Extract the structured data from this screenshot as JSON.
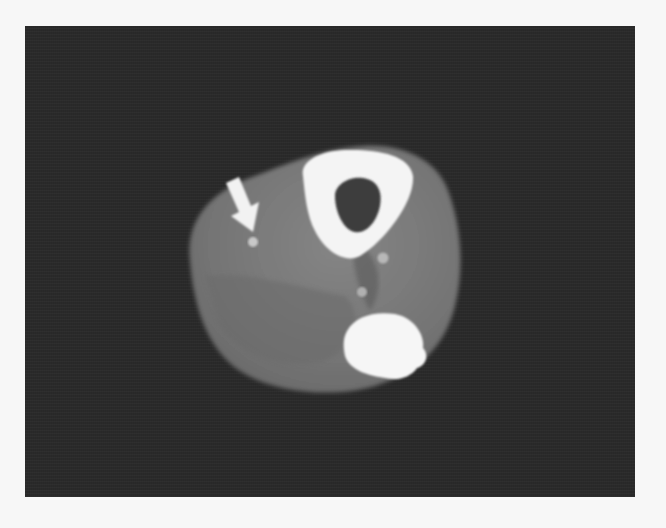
{
  "figure": {
    "type": "axial CT image",
    "colors": {
      "page_background": "#f7f7f7",
      "scan_background": "#2a2a2a",
      "soft_tissue": "#7a7a7a",
      "soft_tissue_dark": "#6a6a6a",
      "bone_cortex": "#f4f4f4",
      "marrow": "#3c3c3c",
      "arrow": "#f2f2f2",
      "vessel_dot": "#c8c8c8"
    },
    "annotations": [
      {
        "kind": "arrow",
        "label": "",
        "points_to": "small bright focus in anterior soft tissue"
      }
    ]
  }
}
